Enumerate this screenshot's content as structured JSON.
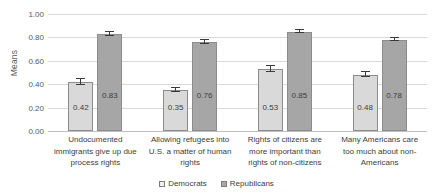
{
  "chart_data": {
    "type": "bar",
    "title": "",
    "xlabel": "",
    "ylabel": "Means",
    "ylim": [
      0.0,
      1.0
    ],
    "ytick_labels": [
      "1.00",
      "0.80",
      "0.60",
      "0.40",
      "0.20",
      "0.00"
    ],
    "ytick_values": [
      1.0,
      0.8,
      0.6,
      0.4,
      0.2,
      0.0
    ],
    "grid": true,
    "legend_position": "bottom",
    "categories": [
      "Undocumented immigrants give up due process rights",
      "Allowing refugees into U.S. a matter of human rights",
      "Rights of citizens are more important than rights of non-citizens",
      "Many Americans care too much about non-Americans"
    ],
    "category_lines": [
      [
        "Undocumented",
        "immigrants give up due",
        "process rights"
      ],
      [
        "Allowing refugees into",
        "U.S. a matter of human",
        "rights"
      ],
      [
        "Rights of citizens are",
        "more important than",
        "rights of non-citizens"
      ],
      [
        "Many Americans care",
        "too much about non-",
        "Americans"
      ]
    ],
    "series": [
      {
        "name": "Democrats",
        "color": "#d9d9d9",
        "values": [
          0.42,
          0.35,
          0.53,
          0.48
        ],
        "labels": [
          "0.42",
          "0.35",
          "0.53",
          "0.48"
        ],
        "errors": [
          0.025,
          0.018,
          0.025,
          0.022
        ]
      },
      {
        "name": "Republicans",
        "color": "#a6a6a6",
        "values": [
          0.83,
          0.76,
          0.85,
          0.78
        ],
        "labels": [
          "0.83",
          "0.76",
          "0.85",
          "0.78"
        ],
        "errors": [
          0.014,
          0.016,
          0.013,
          0.013
        ]
      }
    ]
  },
  "legend": {
    "items": [
      {
        "label": "Democrats"
      },
      {
        "label": "Republicans"
      }
    ]
  },
  "artifact": {
    "top_text": " "
  }
}
